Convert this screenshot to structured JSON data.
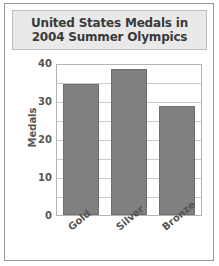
{
  "chart_data": {
    "type": "bar",
    "title": "United States Medals in 2004 Summer Olympics",
    "title_lines": [
      "United States Medals in",
      "2004 Summer Olympics"
    ],
    "categories": [
      "Gold",
      "Silver",
      "Bronze"
    ],
    "values": [
      35,
      39,
      29
    ],
    "xlabel": "",
    "ylabel": "Medals",
    "ylim": [
      0,
      40
    ],
    "yticks": [
      0,
      10,
      20,
      30,
      40
    ],
    "ytick_labels": [
      "0",
      "10",
      "20",
      "30",
      "40"
    ],
    "minor_gridline_step": 5,
    "grid": true,
    "legend": false,
    "bar_color": "#808080",
    "title_background": "#e9e9e9",
    "text_color": "#555555"
  }
}
